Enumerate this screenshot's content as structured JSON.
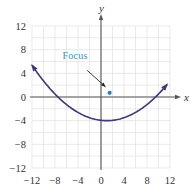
{
  "chart_data": {
    "type": "line",
    "title": "",
    "xlabel": "x",
    "ylabel": "y",
    "xlim": [
      -12,
      12
    ],
    "ylim": [
      -12,
      12
    ],
    "xticks": [
      -12,
      -8,
      -4,
      0,
      4,
      8,
      12
    ],
    "yticks": [
      -12,
      -8,
      -4,
      0,
      4,
      8,
      12
    ],
    "xtick_labels": [
      "−12",
      "−8",
      "−4",
      "0",
      "4",
      "8",
      "12"
    ],
    "ytick_labels": [
      "12",
      "8",
      "4",
      "0",
      "−4",
      "−8",
      "−12"
    ],
    "grid": true,
    "grid_step": 2,
    "series": [
      {
        "name": "parabola",
        "equation": "(x - 1)^2 = 18(y + 4)",
        "vertex": [
          1,
          -4
        ],
        "x_range": [
          -12,
          11.5
        ],
        "arrows": "both",
        "color": "#3b3a7a"
      }
    ],
    "points": [
      {
        "name": "Focus",
        "x": 1.5,
        "y": 0.7,
        "color": "#2f7fbf"
      }
    ],
    "annotations": [
      {
        "text": "Focus",
        "text_at": [
          -4.5,
          6.5
        ],
        "arrow_from": [
          -2.4,
          4.5
        ],
        "arrow_to": [
          0.8,
          1.7
        ]
      }
    ],
    "colors": {
      "curve": "#3b3a7a",
      "focus": "#2f7fbf",
      "annotation_text": "#3a8fc4",
      "grid": "#dcdcdc",
      "axis": "#555555"
    }
  }
}
